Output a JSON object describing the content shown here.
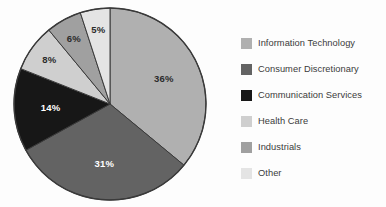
{
  "chart_data": {
    "type": "pie",
    "title": "",
    "subtitle": "",
    "xlabel": "",
    "ylabel": "",
    "grid": false,
    "legend_position": "right",
    "start_angle_deg": 0,
    "direction": "clockwise",
    "units": "percent",
    "categories": [
      "Information Technology",
      "Consumer Discretionary",
      "Communication Services",
      "Health Care",
      "Industrials",
      "Other"
    ],
    "values": [
      36,
      31,
      14,
      8,
      6,
      5
    ],
    "value_labels": [
      "36%",
      "31%",
      "14%",
      "8%",
      "6%",
      "5%"
    ],
    "colors": [
      "#b0b0b0",
      "#636363",
      "#171717",
      "#cfcfcf",
      "#a0a0a0",
      "#e4e4e4"
    ],
    "label_text_colors": [
      "#2b2b2b",
      "#ffffff",
      "#ffffff",
      "#2b2b2b",
      "#2b2b2b",
      "#2b2b2b"
    ],
    "slice_outline_color": "#3a3a3a",
    "total": 100
  },
  "legend": {
    "items": [
      {
        "label": "Information Technology",
        "color": "#b0b0b0"
      },
      {
        "label": "Consumer Discretionary",
        "color": "#636363"
      },
      {
        "label": "Communication Services",
        "color": "#171717"
      },
      {
        "label": "Health Care",
        "color": "#cfcfcf"
      },
      {
        "label": "Industrials",
        "color": "#a0a0a0"
      },
      {
        "label": "Other",
        "color": "#e4e4e4"
      }
    ]
  },
  "colors": {
    "background": "#fdfdfd",
    "legend_text": "#3b3b3b",
    "outline": "#3a3a3a"
  }
}
